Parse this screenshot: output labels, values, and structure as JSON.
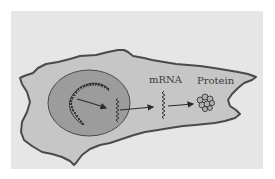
{
  "diagram": {
    "type": "cell-gene-expression",
    "labels": {
      "mrna": "mRNA",
      "protein": "Protein"
    },
    "components": [
      {
        "name": "cell",
        "fill": "#c6c6c6",
        "stroke": "#4a4a4a"
      },
      {
        "name": "nucleus",
        "fill": "#9c9c9c",
        "stroke": "#4a4a4a"
      },
      {
        "name": "dna",
        "description": "coiled double-helix chromosome inside nucleus"
      },
      {
        "name": "nuclear-mrna",
        "description": "wavy mRNA strand inside nucleus"
      },
      {
        "name": "cytoplasmic-mrna",
        "description": "wavy mRNA strand in cytoplasm"
      },
      {
        "name": "protein",
        "description": "clustered folded protein"
      }
    ],
    "arrows": [
      {
        "from": "dna",
        "to": "nuclear-mrna"
      },
      {
        "from": "nuclear-mrna",
        "to": "cytoplasmic-mrna"
      },
      {
        "from": "cytoplasmic-mrna",
        "to": "protein"
      }
    ],
    "colors": {
      "page": "#ffffff",
      "panel": "#e6e6e6",
      "cytoplasm": "#c6c6c6",
      "nucleus": "#9c9c9c",
      "outline": "#4a4a4a",
      "ink": "#2a2a2a"
    }
  }
}
